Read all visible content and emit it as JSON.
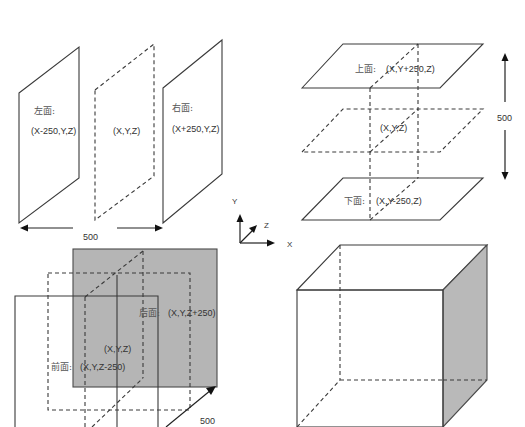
{
  "diagram": {
    "panels": {
      "x_axis_faces": {
        "left_face": {
          "name": "左面:",
          "coords": "(X-250,Y,Z)"
        },
        "center": {
          "coords": "(X,Y,Z)"
        },
        "right_face": {
          "name": "右面:",
          "coords": "(X+250,Y,Z)"
        },
        "dimension": "500"
      },
      "y_axis_faces": {
        "top_face": {
          "name": "上面:",
          "coords": "(X,Y+250,Z)"
        },
        "center": {
          "coords": "(X,Y,Z)"
        },
        "bottom_face": {
          "name": "下面:",
          "coords": "(X,Y-250,Z)"
        },
        "dimension": "500"
      },
      "z_axis_faces": {
        "back_face": {
          "name": "后面:",
          "coords": "(X,Y,Z+250)"
        },
        "center": {
          "coords": "(X,Y,Z)"
        },
        "front_face": {
          "name": "前面:",
          "coords": "(X,Y,Z-250)"
        },
        "dimension": "500"
      },
      "cube": {
        "label": ""
      }
    },
    "axes": {
      "x": "X",
      "y": "Y",
      "z": "Z"
    },
    "colors": {
      "stroke": "#3a3a3a",
      "shaded_face": "#b5b5b5",
      "background": "#ffffff"
    }
  }
}
